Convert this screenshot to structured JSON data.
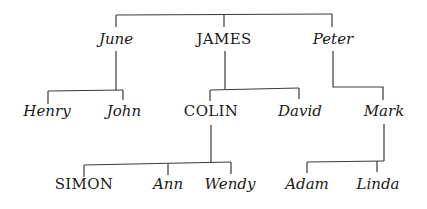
{
  "diagram": {
    "type": "family-tree",
    "generation_1": [
      {
        "name": "June",
        "x": 116,
        "y": 32
      },
      {
        "name": "JAMES",
        "x": 224,
        "y": 32
      },
      {
        "name": "Peter",
        "x": 333,
        "y": 32
      }
    ],
    "generation_2": [
      {
        "name": "Henry",
        "x": 47,
        "y": 104,
        "parent": "June"
      },
      {
        "name": "John",
        "x": 124,
        "y": 104,
        "parent": "June"
      },
      {
        "name": "COLIN",
        "x": 211,
        "y": 104,
        "parent": "JAMES"
      },
      {
        "name": "David",
        "x": 300,
        "y": 104,
        "parent": "JAMES"
      },
      {
        "name": "Mark",
        "x": 384,
        "y": 104,
        "parent": "Peter"
      }
    ],
    "generation_3": [
      {
        "name": "SIMON",
        "x": 84,
        "y": 177,
        "parent": "COLIN"
      },
      {
        "name": "Ann",
        "x": 165,
        "y": 177,
        "parent": "COLIN"
      },
      {
        "name": "Wendy",
        "x": 229,
        "y": 177,
        "parent": "COLIN"
      },
      {
        "name": "Adam",
        "x": 307,
        "y": 177,
        "parent": "Mark"
      },
      {
        "name": "Linda",
        "x": 378,
        "y": 177,
        "parent": "Mark"
      }
    ],
    "line_color": "#3a3a3a",
    "text_color": "#1a1a1a"
  }
}
